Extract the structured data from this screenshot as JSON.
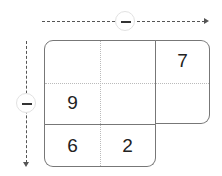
{
  "diagram": {
    "type": "grid-puzzle",
    "columns_arrow": {
      "direction": "right",
      "control": "minus"
    },
    "rows_arrow": {
      "direction": "down",
      "control": "minus"
    },
    "grid": {
      "rows": [
        [
          "",
          "",
          "7"
        ],
        [
          "9",
          "",
          ""
        ],
        [
          "6",
          "2",
          null
        ]
      ]
    },
    "cells": {
      "r0c2": "7",
      "r1c0": "9",
      "r2c0": "6",
      "r2c1": "2"
    }
  }
}
